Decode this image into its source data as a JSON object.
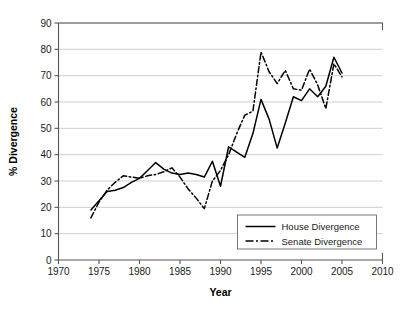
{
  "chart_data": {
    "type": "line",
    "title": "",
    "xlabel": "Year",
    "ylabel": "% Divergence",
    "xlim": [
      1970,
      2010
    ],
    "ylim": [
      0,
      90
    ],
    "xticks": [
      1970,
      1975,
      1980,
      1985,
      1990,
      1995,
      2000,
      2005,
      2010
    ],
    "yticks": [
      0,
      10,
      20,
      30,
      40,
      50,
      60,
      70,
      80,
      90
    ],
    "xtick_labels": [
      "1970",
      "1975",
      "1980",
      "1985",
      "1990",
      "1995",
      "2000",
      "2005",
      "2010"
    ],
    "ytick_labels": [
      "0",
      "10",
      "20",
      "30",
      "40",
      "50",
      "60",
      "70",
      "80",
      "90"
    ],
    "grid": "horizontal",
    "legend_position": "lower-right",
    "series": [
      {
        "name": "House Divergence",
        "style": "solid",
        "color": "#000000",
        "x": [
          1974,
          1975,
          1976,
          1977,
          1978,
          1979,
          1980,
          1981,
          1982,
          1983,
          1984,
          1985,
          1986,
          1987,
          1988,
          1989,
          1990,
          1991,
          1992,
          1993,
          1994,
          1995,
          1996,
          1997,
          1998,
          1999,
          2000,
          2001,
          2002,
          2003,
          2004,
          2005
        ],
        "values": [
          19.0,
          22.5,
          26.0,
          26.5,
          27.5,
          29.5,
          31.0,
          34.0,
          37.0,
          34.5,
          33.0,
          32.5,
          33.0,
          32.5,
          31.5,
          37.5,
          28.0,
          43.0,
          41.0,
          39.0,
          48.0,
          61.0,
          53.5,
          42.5,
          52.0,
          62.0,
          60.5,
          65.0,
          62.0,
          66.0,
          77.0,
          71.0
        ]
      },
      {
        "name": "Senate Divergence",
        "style": "dash-dot",
        "color": "#000000",
        "x": [
          1974,
          1975,
          1976,
          1977,
          1978,
          1979,
          1980,
          1981,
          1982,
          1983,
          1984,
          1985,
          1986,
          1987,
          1988,
          1989,
          1990,
          1991,
          1992,
          1993,
          1994,
          1995,
          1996,
          1997,
          1998,
          1999,
          2000,
          2001,
          2002,
          2003,
          2004,
          2005
        ],
        "values": [
          16.0,
          22.0,
          26.5,
          29.5,
          32.0,
          31.5,
          31.0,
          32.0,
          32.5,
          33.5,
          35.0,
          31.5,
          27.0,
          23.5,
          19.5,
          30.0,
          34.0,
          40.0,
          48.0,
          55.0,
          56.5,
          79.0,
          71.5,
          67.0,
          72.0,
          65.0,
          64.5,
          72.5,
          66.5,
          57.5,
          74.5,
          69.5
        ]
      }
    ]
  },
  "legend": {
    "items": [
      {
        "label": "House Divergence",
        "style": "solid"
      },
      {
        "label": "Senate Divergence",
        "style": "dash-dot"
      }
    ]
  }
}
